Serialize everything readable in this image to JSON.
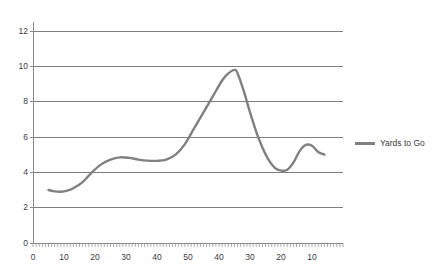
{
  "chart_data": {
    "type": "line",
    "title": "",
    "subtitle": "",
    "xlabel": "",
    "ylabel": "",
    "xlim": [
      0,
      100
    ],
    "ylim": [
      0,
      12
    ],
    "grid": true,
    "legend_position": "right",
    "y_ticks": [
      0,
      2,
      4,
      6,
      8,
      10,
      12
    ],
    "y_tick_labels": [
      "0",
      "2",
      "4",
      "6",
      "8",
      "10",
      "12"
    ],
    "x_major_ticks": [
      0,
      10,
      20,
      30,
      40,
      50,
      60,
      70,
      80,
      90
    ],
    "x_tick_labels": [
      "0",
      "10",
      "20",
      "30",
      "40",
      "50",
      "40",
      "30",
      "20",
      "10"
    ],
    "x_minor_tick_interval": 1,
    "series": [
      {
        "name": "Yards to Go",
        "color": "#808080",
        "x": [
          5,
          7,
          9,
          11,
          13,
          16,
          19,
          22,
          25,
          28,
          31,
          34,
          37,
          40,
          43,
          46,
          49,
          52,
          55,
          58,
          61,
          63,
          65,
          66,
          68,
          70,
          72,
          74,
          76,
          78,
          80,
          82,
          84,
          86,
          88,
          90,
          92,
          94
        ],
        "y": [
          3.0,
          2.92,
          2.9,
          2.96,
          3.1,
          3.45,
          4.0,
          4.45,
          4.72,
          4.85,
          4.82,
          4.72,
          4.66,
          4.65,
          4.72,
          5.0,
          5.6,
          6.5,
          7.4,
          8.3,
          9.2,
          9.6,
          9.8,
          9.6,
          8.6,
          7.4,
          6.3,
          5.4,
          4.7,
          4.25,
          4.1,
          4.15,
          4.55,
          5.2,
          5.55,
          5.5,
          5.15,
          5.0
        ]
      }
    ]
  },
  "legend": {
    "entries": [
      {
        "label": "Yards to Go",
        "color": "#808080"
      }
    ]
  },
  "colors": {
    "line": "#808080",
    "gridline": "#7d7d7d",
    "axis": "#8a8a8a",
    "text": "#3b3b3b",
    "background": "#ffffff"
  }
}
